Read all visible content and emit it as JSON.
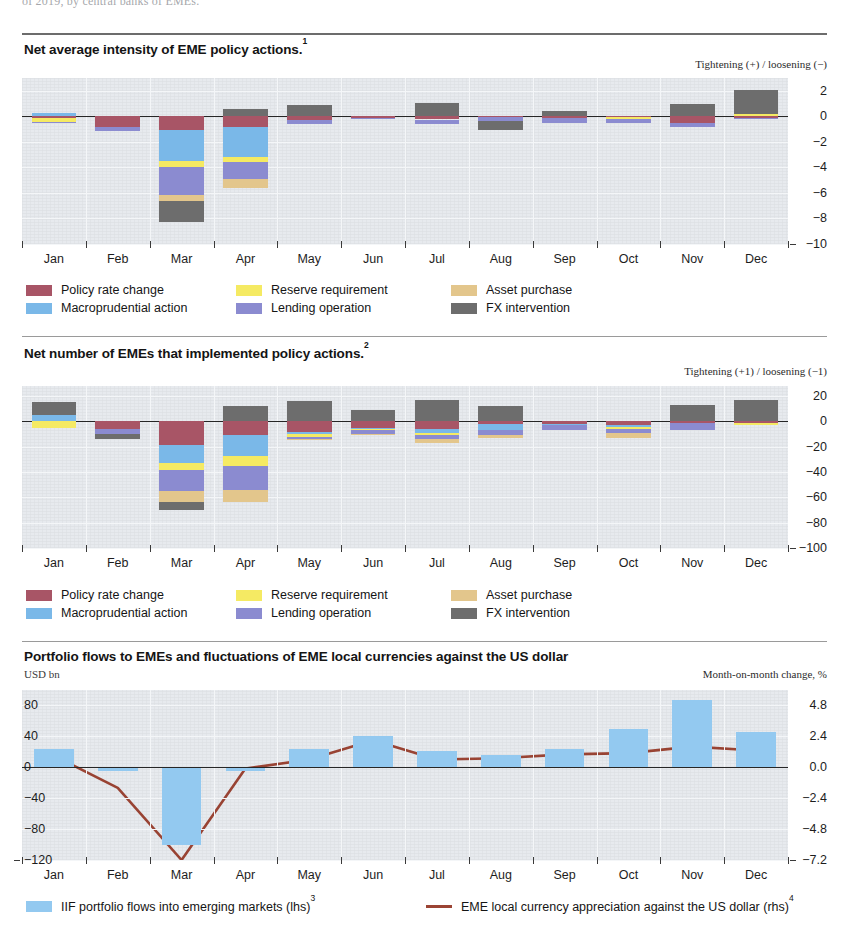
{
  "document": {
    "cut_off_top_line": "of 2019, by central banks of EMEs."
  },
  "colors": {
    "policy_rate_change": "#a85566",
    "macroprudential_action": "#7ab8e8",
    "reserve_requirement": "#f5ea63",
    "lending_operation": "#8b8bd0",
    "asset_purchase": "#e3c68c",
    "fx_intervention": "#6d6d6d",
    "iif_flows": "#93c9f0",
    "fx_line": "#9b4434",
    "plot_background": "#e7eaee",
    "zero_line": "#262626"
  },
  "panels": [
    {
      "id": "panel1",
      "title": "Net average intensity of EME policy actions.",
      "title_note": "1",
      "axis_note_right": "Tightening (+) / loosening (−)",
      "legend": [
        {
          "label": "Policy rate change",
          "color_key": "policy_rate_change",
          "icon": "legend-swatch"
        },
        {
          "label": "Macroprudential action",
          "color_key": "macroprudential_action",
          "icon": "legend-swatch"
        },
        {
          "label": "Reserve requirement",
          "color_key": "reserve_requirement",
          "icon": "legend-swatch"
        },
        {
          "label": "Lending operation",
          "color_key": "lending_operation",
          "icon": "legend-swatch"
        },
        {
          "label": "Asset purchase",
          "color_key": "asset_purchase",
          "icon": "legend-swatch"
        },
        {
          "label": "FX intervention",
          "color_key": "fx_intervention",
          "icon": "legend-swatch"
        }
      ]
    },
    {
      "id": "panel2",
      "title": "Net number of EMEs that implemented policy actions.",
      "title_note": "2",
      "axis_note_right": "Tightening (+1) / loosening (−1)",
      "legend": [
        {
          "label": "Policy rate change",
          "color_key": "policy_rate_change",
          "icon": "legend-swatch"
        },
        {
          "label": "Macroprudential action",
          "color_key": "macroprudential_action",
          "icon": "legend-swatch"
        },
        {
          "label": "Reserve requirement",
          "color_key": "reserve_requirement",
          "icon": "legend-swatch"
        },
        {
          "label": "Lending operation",
          "color_key": "lending_operation",
          "icon": "legend-swatch"
        },
        {
          "label": "Asset purchase",
          "color_key": "asset_purchase",
          "icon": "legend-swatch"
        },
        {
          "label": "FX intervention",
          "color_key": "fx_intervention",
          "icon": "legend-swatch"
        }
      ]
    },
    {
      "id": "panel3",
      "title": "Portfolio flows to EMEs and fluctuations of EME local currencies against the US dollar",
      "title_note": "",
      "axis_label_left": "USD bn",
      "axis_note_right": "Month-on-month change, %",
      "legend": [
        {
          "label": "IIF portfolio flows into emerging markets (lhs)",
          "note": "3",
          "color_key": "iif_flows",
          "icon": "legend-swatch"
        },
        {
          "label": "EME local currency appreciation against the US dollar (rhs)",
          "note": "4",
          "color_key": "fx_line",
          "icon": "legend-line"
        }
      ]
    }
  ],
  "chart_data": [
    {
      "type": "bar",
      "stacked": true,
      "title": "Net average intensity of EME policy actions.",
      "xlabel": "",
      "ylabel": "Tightening (+) / loosening (−)",
      "ylim": [
        -10,
        3
      ],
      "yticks": [
        2,
        0,
        -2,
        -4,
        -6,
        -8,
        -10
      ],
      "grid": true,
      "legend_position": "below",
      "categories": [
        "Jan",
        "Feb",
        "Mar",
        "Apr",
        "May",
        "Jun",
        "Jul",
        "Aug",
        "Sep",
        "Oct",
        "Nov",
        "Dec"
      ],
      "series": [
        {
          "name": "Policy rate change",
          "values": [
            -0.15,
            -0.85,
            -1.1,
            -0.8,
            -0.3,
            -0.1,
            -0.25,
            -0.05,
            -0.1,
            -0.05,
            -0.55,
            -0.1
          ]
        },
        {
          "name": "Macroprudential action",
          "values": [
            0.25,
            0.0,
            -2.4,
            -2.4,
            0.0,
            0.0,
            0.0,
            0.0,
            0.0,
            0.0,
            0.0,
            0.0
          ]
        },
        {
          "name": "Reserve requirement",
          "values": [
            -0.3,
            0.0,
            -0.45,
            -0.35,
            0.0,
            0.0,
            0.0,
            0.0,
            0.0,
            -0.15,
            0.0,
            0.2
          ]
        },
        {
          "name": "Lending operation",
          "values": [
            -0.1,
            -0.3,
            -2.2,
            -1.35,
            -0.3,
            -0.1,
            -0.35,
            -0.3,
            -0.45,
            -0.3,
            -0.25,
            -0.1
          ]
        },
        {
          "name": "Asset purchase",
          "values": [
            0.0,
            0.0,
            -0.45,
            -0.7,
            0.0,
            0.0,
            0.0,
            0.0,
            0.0,
            0.0,
            0.0,
            0.0
          ]
        },
        {
          "name": "FX intervention",
          "values": [
            0.0,
            0.0,
            -1.65,
            0.55,
            0.9,
            0.0,
            1.05,
            -0.7,
            0.4,
            0.0,
            1.0,
            1.85
          ]
        }
      ]
    },
    {
      "type": "bar",
      "stacked": true,
      "title": "Net number of EMEs that implemented policy actions.",
      "xlabel": "",
      "ylabel": "Tightening (+1) / loosening (−1)",
      "ylim": [
        -100,
        28
      ],
      "yticks": [
        20,
        0,
        -20,
        -40,
        -60,
        -80,
        -100
      ],
      "grid": true,
      "legend_position": "below",
      "categories": [
        "Jan",
        "Feb",
        "Mar",
        "Apr",
        "May",
        "Jun",
        "Jul",
        "Aug",
        "Sep",
        "Oct",
        "Nov",
        "Dec"
      ],
      "series": [
        {
          "name": "Policy rate change",
          "values": [
            0,
            -6,
            -19,
            -11,
            -8,
            -5,
            -6,
            -2,
            -2,
            -3,
            -1,
            -1
          ]
        },
        {
          "name": "Macroprudential action",
          "values": [
            5,
            0,
            -14,
            -16,
            -2,
            -1,
            -3,
            -5,
            -1,
            -1,
            0,
            0
          ]
        },
        {
          "name": "Reserve requirement",
          "values": [
            -5,
            0,
            -5,
            -8,
            -2,
            -1,
            -2,
            0,
            0,
            -2,
            0,
            -2
          ]
        },
        {
          "name": "Lending operation",
          "values": [
            0,
            -4,
            -17,
            -19,
            -2,
            -3,
            -3,
            -4,
            -4,
            -3,
            -6,
            0
          ]
        },
        {
          "name": "Asset purchase",
          "values": [
            0,
            0,
            -9,
            -10,
            -1,
            -1,
            -3,
            -2,
            0,
            -4,
            0,
            0
          ]
        },
        {
          "name": "FX intervention",
          "values": [
            10,
            -4,
            -6,
            12,
            16,
            9,
            17,
            12,
            0,
            0,
            13,
            17
          ]
        }
      ]
    },
    {
      "type": "bar+line",
      "title": "Portfolio flows to EMEs and fluctuations of EME local currencies against the US dollar",
      "xlabel": "",
      "ylabel_left": "USD bn",
      "ylabel_right": "Month-on-month change, %",
      "ylim_left": [
        -120,
        100
      ],
      "ylim_right": [
        -7.2,
        6.0
      ],
      "yticks_left": [
        80,
        40,
        0,
        -40,
        -80,
        -120
      ],
      "yticks_right": [
        "4.8",
        "2.4",
        "0.0",
        "-2.4",
        "-4.8",
        "-7.2"
      ],
      "grid": true,
      "legend_position": "below",
      "categories": [
        "Jan",
        "Feb",
        "Mar",
        "Apr",
        "May",
        "Jun",
        "Jul",
        "Aug",
        "Sep",
        "Oct",
        "Nov",
        "Dec"
      ],
      "series": [
        {
          "name": "IIF portfolio flows into emerging markets (lhs)",
          "type": "bar",
          "axis": "left",
          "values": [
            24,
            -5,
            -100,
            -5,
            24,
            40,
            21,
            16,
            24,
            49,
            87,
            46
          ]
        },
        {
          "name": "EME local currency appreciation against the US dollar (rhs)",
          "type": "line",
          "axis": "right",
          "values": [
            0.9,
            -1.6,
            -7.2,
            -0.1,
            0.6,
            2.1,
            0.6,
            0.7,
            1.0,
            1.1,
            1.6,
            1.3
          ]
        }
      ]
    }
  ]
}
